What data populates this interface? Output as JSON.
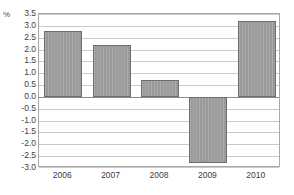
{
  "chart_data": {
    "type": "bar",
    "title": "",
    "subtitle": "",
    "xlabel": "",
    "ylabel": "%",
    "unit_label": "%",
    "categories": [
      "2006",
      "2007",
      "2008",
      "2009",
      "2010"
    ],
    "values": [
      2.8,
      2.2,
      0.7,
      -2.8,
      3.2
    ],
    "series": [
      {
        "name": "",
        "values": [
          2.8,
          2.2,
          0.7,
          -2.8,
          3.2
        ]
      }
    ],
    "ylim": [
      -3.0,
      3.5
    ],
    "ytick_labels": [
      "3.5",
      "3.0",
      "2.5",
      "2.0",
      "1.5",
      "1.0",
      "0.5",
      "0.0",
      "-0.5",
      "-1.0",
      "-1.5",
      "-2.0",
      "-2.5",
      "-3.0"
    ],
    "ytick_values": [
      3.5,
      3.0,
      2.5,
      2.0,
      1.5,
      1.0,
      0.5,
      0.0,
      -0.5,
      -1.0,
      -1.5,
      -2.0,
      -2.5,
      -3.0
    ],
    "ytick_step": 0.5,
    "grid": true,
    "grid_axis": "y",
    "legend": false,
    "legend_position": "none",
    "zero_line": 0.0,
    "annotations": [],
    "colors": {
      "bar_fill": "#9c9c9c",
      "bar_border": "#6e6e6e",
      "gridline": "#c9c9c9",
      "zero_line": "#8a8a8a",
      "frame": "#a8a8a8",
      "text": "#3d3d3d",
      "background": "#ffffff"
    }
  }
}
